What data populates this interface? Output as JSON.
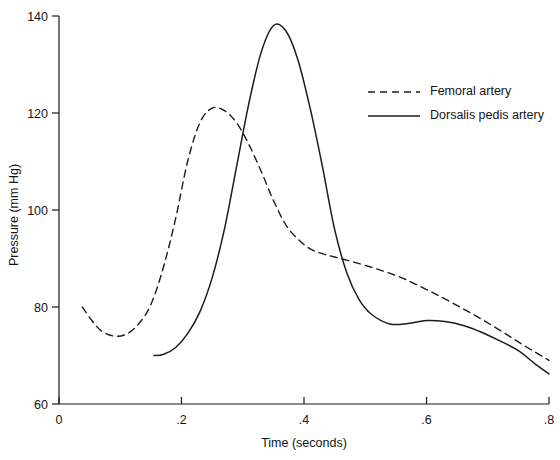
{
  "chart_data": {
    "type": "line",
    "title": "",
    "xlabel": "Time (seconds)",
    "ylabel": "Pressure (mm Hg)",
    "xlim": [
      0,
      0.8
    ],
    "ylim": [
      60,
      140
    ],
    "xticks": [
      "0",
      ".2",
      ".4",
      ".6",
      ".8"
    ],
    "xtick_values": [
      0,
      0.2,
      0.4,
      0.6,
      0.8
    ],
    "yticks": [
      "60",
      "80",
      "100",
      "120",
      "140"
    ],
    "ytick_values": [
      60,
      80,
      100,
      120,
      140
    ],
    "grid": false,
    "legend_position": "upper right",
    "series": [
      {
        "name": "Femoral artery",
        "style": "dashed",
        "color": "#1c1c1c",
        "x": [
          0.038,
          0.055,
          0.07,
          0.09,
          0.11,
          0.13,
          0.15,
          0.17,
          0.19,
          0.21,
          0.23,
          0.25,
          0.27,
          0.29,
          0.31,
          0.33,
          0.35,
          0.37,
          0.39,
          0.41,
          0.43,
          0.45,
          0.48,
          0.52,
          0.56,
          0.6,
          0.64,
          0.68,
          0.72,
          0.76,
          0.8
        ],
        "y": [
          80.0,
          77.0,
          75.0,
          74.0,
          74.4,
          76.5,
          80.5,
          88.0,
          98.0,
          110.0,
          118.0,
          121.0,
          120.5,
          118.0,
          113.5,
          108.0,
          102.0,
          97.0,
          94.0,
          92.0,
          91.0,
          90.3,
          89.3,
          87.8,
          86.0,
          83.6,
          81.0,
          78.2,
          75.2,
          72.0,
          69.0
        ]
      },
      {
        "name": "Dorsalis pedis artery",
        "style": "solid",
        "color": "#1c1c1c",
        "x": [
          0.155,
          0.17,
          0.19,
          0.21,
          0.23,
          0.25,
          0.27,
          0.29,
          0.31,
          0.33,
          0.35,
          0.37,
          0.39,
          0.41,
          0.43,
          0.45,
          0.47,
          0.49,
          0.51,
          0.54,
          0.57,
          0.6,
          0.63,
          0.66,
          0.69,
          0.72,
          0.75,
          0.78,
          0.8
        ],
        "y": [
          70.0,
          70.2,
          71.6,
          74.5,
          79.0,
          86.0,
          96.0,
          109.0,
          122.0,
          132.5,
          138.0,
          137.0,
          131.0,
          121.0,
          109.0,
          96.0,
          87.0,
          81.5,
          78.5,
          76.5,
          76.6,
          77.2,
          77.0,
          76.2,
          74.8,
          73.0,
          71.0,
          68.0,
          66.2
        ]
      }
    ]
  },
  "legend": {
    "items": [
      {
        "label": "Femoral artery",
        "style": "dashed"
      },
      {
        "label": "Dorsalis pedis artery",
        "style": "solid"
      }
    ]
  },
  "axes": {
    "y_title": "Pressure (mm Hg)",
    "x_title": "Time (seconds)"
  }
}
